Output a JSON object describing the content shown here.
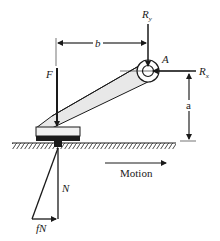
{
  "diagram": {
    "labels": {
      "force_F": "F",
      "reaction_Ry": "R",
      "reaction_Ry_sub": "y",
      "reaction_Rx": "R",
      "reaction_Rx_sub": "x",
      "pivot_A": "A",
      "dimension_b": "b",
      "dimension_a": "a",
      "normal_N": "N",
      "friction_fN": "fN",
      "motion": "Motion"
    },
    "colors": {
      "ink": "#1a1a1a",
      "arm_fill": "#e8e8e8",
      "shoe_fill": "#f0f0f0"
    }
  }
}
